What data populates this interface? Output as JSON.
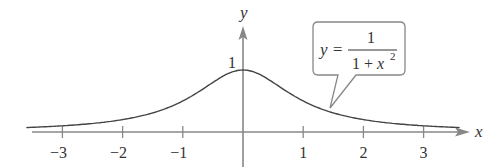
{
  "chart_data": {
    "type": "line",
    "title": "",
    "function": "y = 1/(1+x^2)",
    "xlabel": "x",
    "ylabel": "y",
    "xlim": [
      -3.9,
      3.7
    ],
    "ylim": [
      0,
      1.6
    ],
    "x_ticks": [
      -3,
      -2,
      -1,
      1,
      2,
      3
    ],
    "x_tick_labels": [
      "−3",
      "−2",
      "−1",
      "1",
      "2",
      "3"
    ],
    "y_ticks": [
      1
    ],
    "y_tick_labels": [
      "1"
    ],
    "grid": false,
    "legend": null,
    "series": [
      {
        "name": "y = 1/(1+x²)",
        "x": [
          -3.6,
          -3,
          -2.5,
          -2,
          -1.5,
          -1,
          -0.5,
          0,
          0.5,
          1,
          1.5,
          2,
          2.5,
          3,
          3.6
        ],
        "y": [
          0.072,
          0.1,
          0.138,
          0.2,
          0.308,
          0.5,
          0.8,
          1,
          0.8,
          0.5,
          0.308,
          0.2,
          0.138,
          0.1,
          0.072
        ]
      }
    ],
    "annotations": [
      {
        "type": "callout",
        "text_lhs": "y =",
        "numerator": "1",
        "denominator": "1 + x",
        "exponent": "2",
        "points_to_x": 1.4
      }
    ]
  },
  "axes": {
    "x_label": "x",
    "y_label": "y",
    "y_one_label": "1"
  },
  "callout": {
    "lhs": "y =",
    "numerator": "1",
    "denominator": "1 + x",
    "exponent": "2"
  },
  "colors": {
    "axis": "#888888",
    "curve": "#444444",
    "text": "#333333",
    "callout_border": "#888888"
  }
}
